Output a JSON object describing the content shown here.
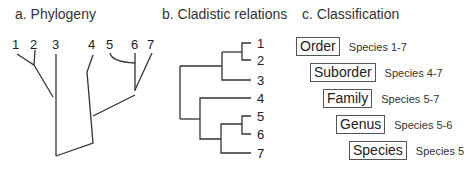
{
  "panels": {
    "a": {
      "title": "a. Phylogeny",
      "leaves": [
        "1",
        "2",
        "3",
        "4",
        "5",
        "6",
        "7"
      ]
    },
    "b": {
      "title": "b. Cladistic relations",
      "leaves": [
        "1",
        "2",
        "3",
        "4",
        "5",
        "6",
        "7"
      ]
    },
    "c": {
      "title": "c. Classification",
      "ranks": [
        {
          "rank": "Order",
          "members": "Species 1-7"
        },
        {
          "rank": "Suborder",
          "members": "Species 4-7"
        },
        {
          "rank": "Family",
          "members": "Species 5-7"
        },
        {
          "rank": "Genus",
          "members": "Species 5-6"
        },
        {
          "rank": "Species",
          "members": "Species 5"
        }
      ]
    }
  }
}
